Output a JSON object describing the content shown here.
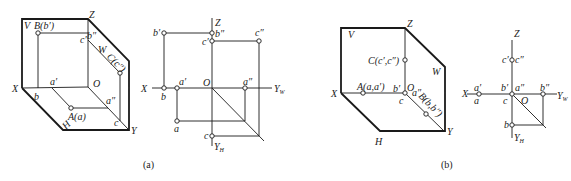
{
  "figure_a": {
    "caption": "(a)",
    "pictorial": {
      "plane_labels": {
        "V": "V",
        "H": "H",
        "W": "W"
      },
      "axis_labels": {
        "X": "X",
        "Y": "Y",
        "Z": "Z",
        "O": "O"
      },
      "points": {
        "A": "A(a)",
        "B": "B(b′)",
        "C": "C(c″)"
      },
      "projection_labels": {
        "a_prime": "a′",
        "a_double": "a″",
        "b": "b",
        "b_double": "b″",
        "c_prime": "c′",
        "c": "c"
      }
    },
    "orthographic": {
      "axis_labels": {
        "X": "X",
        "Z": "Z",
        "O": "O",
        "YW": "Y",
        "YW_sub": "W",
        "YH": "Y",
        "YH_sub": "H"
      },
      "labels": {
        "b_prime": "b′",
        "b_double": "b″",
        "c_prime": "c′",
        "c_double": "c″",
        "b": "b",
        "a_prime": "a′",
        "a_double": "a″",
        "a": "a",
        "c": "c"
      }
    }
  },
  "figure_b": {
    "caption": "(b)",
    "pictorial": {
      "plane_labels": {
        "V": "V",
        "H": "H",
        "W": "W"
      },
      "axis_labels": {
        "X": "X",
        "Y": "Y",
        "Z": "Z",
        "O": "O"
      },
      "points": {
        "A": "A(a,a′)",
        "B": "B(b,b″)",
        "C": "C(c′,c″)"
      },
      "projection_labels": {
        "b_prime": "b′",
        "a_double": "a″",
        "c": "c"
      }
    },
    "orthographic": {
      "axis_labels": {
        "X": "X",
        "Z": "Z",
        "O": "O",
        "YW": "Y",
        "YW_sub": "W",
        "YH": "Y",
        "YH_sub": "H"
      },
      "labels": {
        "c_prime": "c′",
        "c_double": "c″",
        "a_prime": "a′",
        "a": "a",
        "b_prime": "b′",
        "a_double": "a″",
        "c": "c",
        "b_double": "b″",
        "b": "b"
      }
    }
  }
}
